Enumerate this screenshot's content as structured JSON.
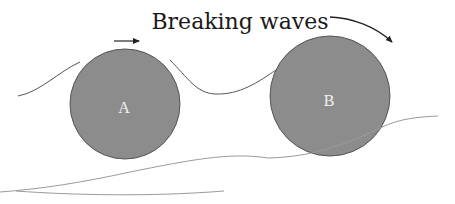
{
  "title": "Breaking waves",
  "stones": [
    {
      "id": "A",
      "label": "A",
      "motion": "translating right"
    },
    {
      "id": "B",
      "label": "B",
      "motion": "rotating clockwise"
    }
  ],
  "colors": {
    "stone_fill": "#8c8c8c",
    "stone_outline": "#555555",
    "line": "#555555",
    "ground": "#9a9a9a",
    "label_text": "#f2f2f2"
  }
}
